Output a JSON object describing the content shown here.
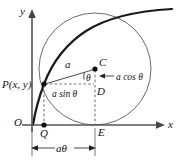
{
  "figure": {
    "axes": {
      "x_label": "x",
      "y_label": "y",
      "origin_label": "O"
    },
    "points": [
      {
        "id": "P",
        "label": "P(x, y)",
        "x": 44,
        "y": 84
      },
      {
        "id": "C",
        "label": "C",
        "x": 95,
        "y": 69
      },
      {
        "id": "D",
        "label": "D",
        "x": 95,
        "y": 84
      },
      {
        "id": "E",
        "label": "E",
        "x": 95,
        "y": 125
      },
      {
        "id": "Q",
        "label": "Q",
        "x": 44,
        "y": 125
      }
    ],
    "labels": {
      "radius": "a",
      "angle": "θ",
      "horizontal_leg": "a sin θ",
      "vertical_leg": "a cos θ",
      "arc_length": "aθ"
    },
    "colors": {
      "curve": "#1a1a1a",
      "circle": "#5a5a5a",
      "axis": "#555555",
      "dashed": "#777777",
      "text": "#111111"
    },
    "geometry": {
      "circle_center_x": 95,
      "circle_center_y": 69,
      "circle_radius": 56,
      "baseline_y": 125,
      "yaxis_x": 32
    }
  }
}
